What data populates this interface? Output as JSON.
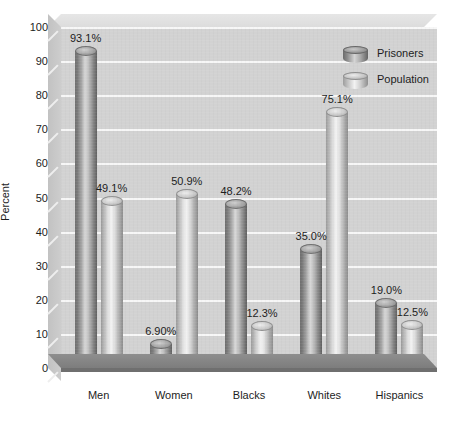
{
  "chart_data": {
    "type": "bar",
    "title": "",
    "xlabel": "",
    "ylabel": "Percent",
    "ylim": [
      0,
      100
    ],
    "ytick_step": 10,
    "yticks": [
      100,
      90,
      80,
      70,
      60,
      50,
      40,
      30,
      20,
      10,
      0
    ],
    "ytick_labels": [
      "100",
      "90",
      "80",
      "70",
      "60",
      "50",
      "40",
      "30",
      "20",
      "10",
      "0"
    ],
    "categories": [
      "Men",
      "Women",
      "Blacks",
      "Whites",
      "Hispanics"
    ],
    "grid": true,
    "grid_axis": "y",
    "legend_position": "top-right",
    "style": "3d-cylinder",
    "series": [
      {
        "name": "Prisoners",
        "color": "#8a8a8a",
        "values": [
          93.1,
          6.9,
          48.2,
          35.0,
          19.0
        ],
        "value_labels": [
          "93.1%",
          "6.90%",
          "48.2%",
          "35.0%",
          "19.0%"
        ]
      },
      {
        "name": "Population",
        "color": "#d0d0d0",
        "values": [
          49.1,
          50.9,
          12.3,
          75.1,
          12.5
        ],
        "value_labels": [
          "49.1%",
          "50.9%",
          "12.3%",
          "75.1%",
          "12.5%"
        ]
      }
    ]
  },
  "colors": {
    "plot_background": "#d2d2d2",
    "gridline": "#f7f7f7",
    "floor": "#8e8e8e",
    "text": "#1d1d1d",
    "page_background": "#ffffff"
  }
}
